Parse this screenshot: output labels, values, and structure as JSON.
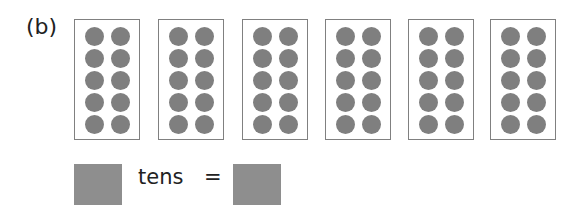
{
  "label": "(b)",
  "frames": [
    {
      "dots": 10,
      "left": 74
    },
    {
      "dots": 10,
      "left": 158
    },
    {
      "dots": 10,
      "left": 242
    },
    {
      "dots": 10,
      "left": 325
    },
    {
      "dots": 10,
      "left": 408
    },
    {
      "dots": 10,
      "left": 490
    }
  ],
  "equation": {
    "word": "tens",
    "equals": "=",
    "box1_color": "#8e8e8e",
    "box2_color": "#8e8e8e"
  },
  "colors": {
    "dot": "#7f7f7f",
    "frame_border": "#808080"
  }
}
